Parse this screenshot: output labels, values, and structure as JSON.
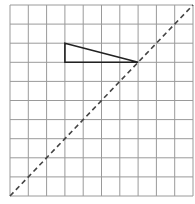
{
  "diagram": {
    "type": "grid-reflection",
    "grid": {
      "columns": 10,
      "rows": 10,
      "left": 10,
      "top": 5,
      "right": 193,
      "bottom": 196,
      "line_color": "#9a9a9a",
      "border_color": "#9a9a9a"
    },
    "triangle": {
      "grid_vertices": [
        [
          3,
          2
        ],
        [
          3,
          3
        ],
        [
          7,
          3
        ]
      ],
      "stroke_color": "#222222"
    },
    "mirror_line": {
      "from_grid": [
        0,
        10
      ],
      "to_grid": [
        10,
        0
      ],
      "style": "dashed",
      "stroke_color": "#444444"
    }
  }
}
